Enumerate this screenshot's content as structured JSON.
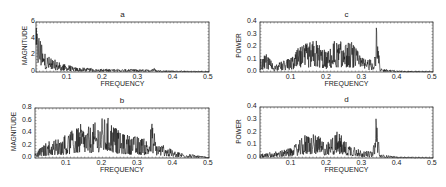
{
  "chart_data": [
    {
      "id": "a",
      "type": "line",
      "title": "a",
      "xlabel": "FREQUENCY",
      "ylabel": "MAGNITUDE",
      "xlim": [
        0.01,
        0.5
      ],
      "ylim": [
        0,
        6
      ],
      "xticks": [
        "0.1",
        "0.2",
        "0.3",
        "0.4",
        "0.5"
      ],
      "yticks": [
        "0",
        "2",
        "4",
        "6"
      ],
      "description": "Magnitude spectrum decaying from ~5.5 near f=0.02 to ~0.3 by f=0.15, small peak near 0.34, ~0.1 beyond 0.4",
      "envelope": {
        "x": [
          0.01,
          0.02,
          0.03,
          0.05,
          0.08,
          0.12,
          0.18,
          0.25,
          0.33,
          0.34,
          0.35,
          0.4,
          0.5
        ],
        "y": [
          5.6,
          5.0,
          2.6,
          1.8,
          1.1,
          0.6,
          0.4,
          0.35,
          0.3,
          0.7,
          0.25,
          0.15,
          0.1
        ]
      }
    },
    {
      "id": "b",
      "type": "line",
      "title": "b",
      "xlabel": "FREQUENCY",
      "ylabel": "MAGNITUDE",
      "xlim": [
        0.01,
        0.5
      ],
      "ylim": [
        0,
        0.8
      ],
      "xticks": [
        "0.1",
        "0.2",
        "0.3",
        "0.4",
        "0.5"
      ],
      "yticks": [
        "0.0",
        "0.2",
        "0.4",
        "0.6",
        "0.8"
      ],
      "description": "Broadband magnitude spectrum, peaks ~0.65 near 0.2-0.22, peak ~0.58 at 0.34, decays to ~0 at 0.5",
      "envelope": {
        "x": [
          0.01,
          0.05,
          0.1,
          0.14,
          0.16,
          0.2,
          0.22,
          0.25,
          0.3,
          0.33,
          0.34,
          0.35,
          0.4,
          0.45,
          0.5
        ],
        "y": [
          0.1,
          0.28,
          0.38,
          0.55,
          0.5,
          0.65,
          0.66,
          0.4,
          0.35,
          0.3,
          0.58,
          0.28,
          0.12,
          0.06,
          0.01
        ]
      }
    },
    {
      "id": "c",
      "type": "line",
      "title": "c",
      "xlabel": "FREQUENCY",
      "ylabel": "POWER",
      "xlim": [
        0.01,
        0.5
      ],
      "ylim": [
        0,
        0.4
      ],
      "xticks": [
        "0.1",
        "0.2",
        "0.3",
        "0.4",
        "0.5"
      ],
      "yticks": [
        "0.0",
        "0.1",
        "0.2",
        "0.3",
        "0.4"
      ],
      "description": "Power spectrum with many spikes 0.1-0.3 (max ~0.27 at 0.17), dominant peak ~0.38 at 0.34, low tail after 0.36",
      "envelope": {
        "x": [
          0.01,
          0.03,
          0.05,
          0.1,
          0.12,
          0.17,
          0.2,
          0.22,
          0.27,
          0.3,
          0.33,
          0.34,
          0.35,
          0.4,
          0.5
        ],
        "y": [
          0.1,
          0.15,
          0.06,
          0.12,
          0.2,
          0.27,
          0.15,
          0.25,
          0.24,
          0.12,
          0.1,
          0.38,
          0.03,
          0.01,
          0.005
        ]
      }
    },
    {
      "id": "d",
      "type": "line",
      "title": "d",
      "xlabel": "FREQUENCY",
      "ylabel": "POWER",
      "xlim": [
        0.01,
        0.5
      ],
      "ylim": [
        0,
        0.4
      ],
      "xticks": [
        "0.1",
        "0.2",
        "0.3",
        "0.4",
        "0.5"
      ],
      "yticks": [
        "0.0",
        "0.1",
        "0.2",
        "0.3",
        "0.4"
      ],
      "description": "Power spectrum, spikes ~0.19-0.22 between 0.13 and 0.23, dominant peak ~0.37 at 0.34, near zero after 0.4",
      "envelope": {
        "x": [
          0.01,
          0.05,
          0.1,
          0.14,
          0.17,
          0.2,
          0.23,
          0.25,
          0.3,
          0.33,
          0.34,
          0.35,
          0.4,
          0.5
        ],
        "y": [
          0.03,
          0.05,
          0.08,
          0.19,
          0.19,
          0.12,
          0.22,
          0.14,
          0.06,
          0.05,
          0.37,
          0.03,
          0.01,
          0.003
        ]
      }
    }
  ]
}
